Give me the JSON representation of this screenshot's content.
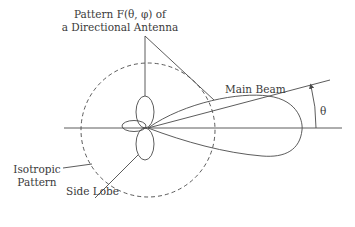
{
  "diagram": {
    "type": "antenna radiation pattern",
    "labels": {
      "pattern_line1": "Pattern F(θ, φ) of",
      "pattern_line2": "a Directional Antenna",
      "main_beam": "Main Beam",
      "theta": "θ",
      "isotropic_line1": "Isotropic",
      "isotropic_line2": "Pattern",
      "side_lobe": "Side Lobe"
    },
    "colors": {
      "stroke": "#4a4a4a",
      "text": "#3a3a3a",
      "background": "#ffffff"
    }
  }
}
